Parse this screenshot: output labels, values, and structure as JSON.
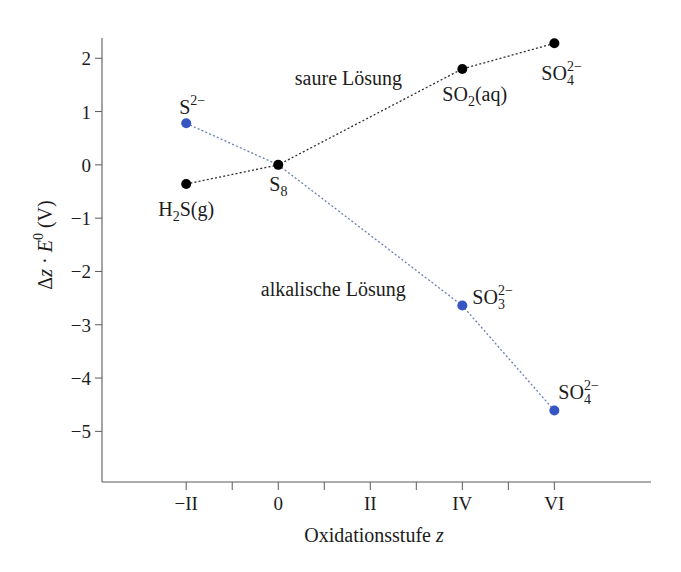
{
  "chart_data": {
    "type": "line",
    "title": "",
    "xlabel": "Oxidationsstufe z",
    "xlabel_parts": [
      [
        "Oxidationsstufe "
      ],
      [
        "z",
        "italic"
      ]
    ],
    "ylabel": "Δz · E⁰ (V)",
    "ylabel_parts": [
      [
        "Δ"
      ],
      [
        "z",
        "italic"
      ],
      [
        " · "
      ],
      [
        "E",
        "italic"
      ],
      [
        "0",
        "sup"
      ],
      [
        " (V)"
      ]
    ],
    "xlim": [
      -3.83,
      8.1
    ],
    "ylim": [
      -5.95,
      2.38
    ],
    "grid": false,
    "legend": null,
    "x_ticks": [
      {
        "value": -2,
        "label": "−II"
      },
      {
        "value": -1,
        "label": ""
      },
      {
        "value": 0,
        "label": "0"
      },
      {
        "value": 1,
        "label": ""
      },
      {
        "value": 2,
        "label": "II"
      },
      {
        "value": 3,
        "label": ""
      },
      {
        "value": 4,
        "label": "IV"
      },
      {
        "value": 5,
        "label": ""
      },
      {
        "value": 6,
        "label": "VI"
      }
    ],
    "y_ticks": [
      {
        "value": 2,
        "label": "2"
      },
      {
        "value": 1,
        "label": "1"
      },
      {
        "value": 0,
        "label": "0"
      },
      {
        "value": -1,
        "label": "−1"
      },
      {
        "value": -2,
        "label": "−2"
      },
      {
        "value": -3,
        "label": "−3"
      },
      {
        "value": -4,
        "label": "−4"
      },
      {
        "value": -5,
        "label": "−5"
      }
    ],
    "series": [
      {
        "name": "saure Lösung",
        "marker_color": "#000000",
        "line_color": "#2e2e2e",
        "x": [
          -2,
          0,
          4,
          6
        ],
        "y": [
          -0.36,
          0,
          1.8,
          2.28
        ],
        "points": [
          {
            "z": -2,
            "v": -0.36,
            "label_text": "H₂S(g)",
            "label": [
              [
                "H"
              ],
              [
                "2",
                "sub"
              ],
              [
                "S(g)"
              ]
            ],
            "label_dx": -28,
            "label_dy": 32
          },
          {
            "z": 0,
            "v": 0,
            "label_text": "S₈",
            "label": [
              [
                "S"
              ],
              [
                "8",
                "sub"
              ]
            ],
            "label_dx": -9,
            "label_dy": 26
          },
          {
            "z": 4,
            "v": 1.8,
            "label_text": "SO₂(aq)",
            "label": [
              [
                "SO"
              ],
              [
                "2",
                "sub"
              ],
              [
                "(aq)"
              ]
            ],
            "label_dx": -20,
            "label_dy": 32
          },
          {
            "z": 6,
            "v": 2.28,
            "label_text": "SO₄²⁻",
            "label": [
              [
                "SO"
              ],
              [
                "4",
                "subsup",
                "2−"
              ]
            ],
            "label_dx": -13,
            "label_dy": 37
          }
        ]
      },
      {
        "name": "alkalische Lösung",
        "marker_color": "#3556c4",
        "line_color": "#6b7db6",
        "x": [
          -2,
          0,
          4,
          6
        ],
        "y": [
          0.78,
          0,
          -2.64,
          -4.61
        ],
        "points": [
          {
            "z": -2,
            "v": 0.78,
            "label_text": "S²⁻",
            "label": [
              [
                "S"
              ],
              [
                "2−",
                "sup"
              ]
            ],
            "label_dx": -7,
            "label_dy": -9
          },
          {
            "z": 0,
            "v": 0,
            "label_text": "S₈",
            "label": null,
            "marker": false
          },
          {
            "z": 4,
            "v": -2.64,
            "label_text": "SO₃²⁻",
            "label": [
              [
                "SO"
              ],
              [
                "3",
                "subsup",
                "2−"
              ]
            ],
            "label_dx": 10,
            "label_dy": -2
          },
          {
            "z": 6,
            "v": -4.61,
            "label_text": "SO₄²⁻",
            "label": [
              [
                "SO"
              ],
              [
                "4",
                "subsup",
                "2−"
              ]
            ],
            "label_dx": 4,
            "label_dy": -12
          }
        ]
      }
    ],
    "annotations": [
      {
        "text": "saure Lösung",
        "z": 0.36,
        "v": 1.5
      },
      {
        "text": "alkalische Lösung",
        "z": -0.38,
        "v": -2.46
      }
    ]
  }
}
